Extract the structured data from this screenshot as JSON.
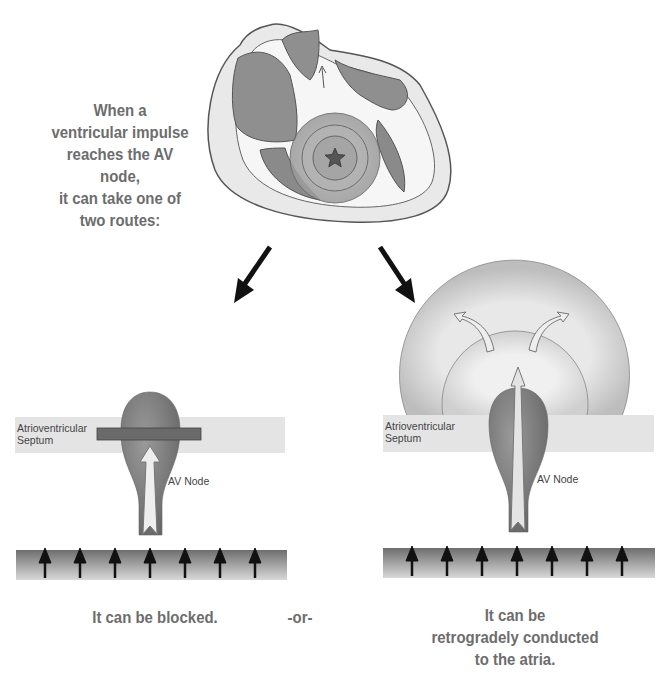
{
  "intro_text": {
    "lines": [
      "When a",
      "ventricular impulse",
      "reaches the AV node,",
      "it can take one of",
      "two routes:"
    ]
  },
  "left_panel": {
    "septum_label_1": "Atrioventricular",
    "septum_label_2": "Septum",
    "node_label": "AV Node",
    "caption": "It can be blocked."
  },
  "separator": "-or-",
  "right_panel": {
    "septum_label_1": "Atrioventricular",
    "septum_label_2": "Septum",
    "node_label": "AV Node",
    "caption_lines": [
      "It can be",
      "retrogradely conducted",
      "to the atria."
    ]
  },
  "icons": {
    "origin": "star-icon",
    "ventricle_arrows_count": 7
  },
  "colors": {
    "text": "#6d6d6d",
    "septum": "#e4e4e4",
    "node": "#7a7a7a",
    "block_bar": "#6a6a6a",
    "arrow": "#111111"
  }
}
